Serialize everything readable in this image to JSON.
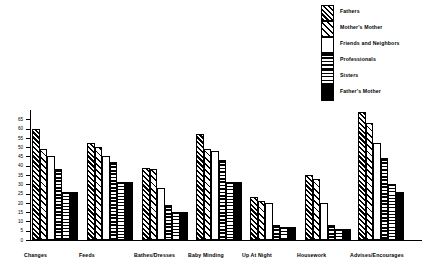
{
  "chart_data": {
    "type": "bar",
    "title": "",
    "xlabel": "",
    "ylabel": "Number of Families",
    "ylim": [
      0,
      70
    ],
    "ytick_step": 5,
    "yticks": [
      0,
      5,
      10,
      15,
      20,
      25,
      30,
      35,
      40,
      45,
      50,
      55,
      60,
      65
    ],
    "grid": false,
    "legend_position": "top-right",
    "categories": [
      "Changes",
      "Feeds",
      "Bathes/Dresses",
      "Baby Minding",
      "Up At Night",
      "Housework",
      "Advises/Encourages"
    ],
    "series": [
      {
        "name": "Fathers",
        "pattern": "diagonal-dense",
        "values": [
          60,
          52,
          39,
          57,
          23,
          35,
          69
        ]
      },
      {
        "name": "Mother's Mother",
        "pattern": "diagonal-sparse",
        "values": [
          49,
          50,
          38,
          49,
          21,
          33,
          63
        ]
      },
      {
        "name": "Friends and Neighbors",
        "pattern": "white",
        "values": [
          45,
          45,
          28,
          48,
          20,
          20,
          52
        ]
      },
      {
        "name": "Professionals",
        "pattern": "horizontal-thick",
        "values": [
          38,
          42,
          19,
          43,
          8,
          8,
          44
        ]
      },
      {
        "name": "Sisters",
        "pattern": "horizontal-thin",
        "values": [
          26,
          31,
          15,
          31,
          7,
          6,
          30
        ]
      },
      {
        "name": "Father's Mother",
        "pattern": "solid-black",
        "values": [
          26,
          31,
          15,
          31,
          7,
          6,
          26
        ]
      }
    ]
  },
  "legend": {
    "items": [
      {
        "label": "Fathers",
        "pattern": "diagonal-dense"
      },
      {
        "label": "Mother's Mother",
        "pattern": "diagonal-sparse"
      },
      {
        "label": "Friends and Neighbors",
        "pattern": "white"
      },
      {
        "label": "Professionals",
        "pattern": "horizontal-thick"
      },
      {
        "label": "Sisters",
        "pattern": "horizontal-thin"
      },
      {
        "label": "Father's Mother",
        "pattern": "solid-black"
      }
    ]
  },
  "colors": {
    "ink": "#000000",
    "background": "#ffffff"
  }
}
